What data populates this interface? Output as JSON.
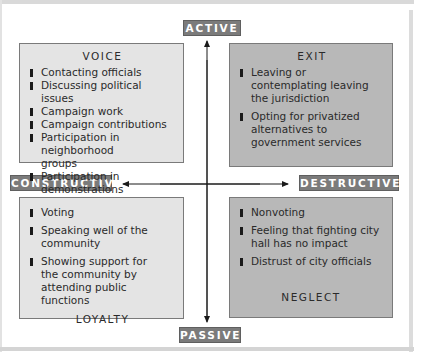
{
  "axes": {
    "top": "ACTIVE",
    "bottom": "PASSIVE",
    "left": "CONSTRUCTIVE",
    "right": "DESTRUCTIVE"
  },
  "quadrants": {
    "voice": {
      "title": "VOICE",
      "items": [
        "Contacting officials",
        "Discussing political issues",
        "Campaign work",
        "Campaign contributions",
        "Participation in neighborhood groups",
        "Participation in demonstrations"
      ]
    },
    "exit": {
      "title": "EXIT",
      "items": [
        "Leaving or contemplating leaving the jurisdiction",
        "Opting for privatized alternatives to government services"
      ]
    },
    "loyalty": {
      "title": "LOYALTY",
      "items": [
        "Voting",
        "Speaking well of the community",
        "Showing support for the community by attending public functions"
      ]
    },
    "neglect": {
      "title": "NEGLECT",
      "items": [
        "Nonvoting",
        "Feeling that fighting city hall has no impact",
        "Distrust of city officials"
      ]
    }
  },
  "colors": {
    "light_box": "#e4e4e4",
    "dark_box": "#b8b8b8",
    "label_bg": "#7b7b7b"
  }
}
